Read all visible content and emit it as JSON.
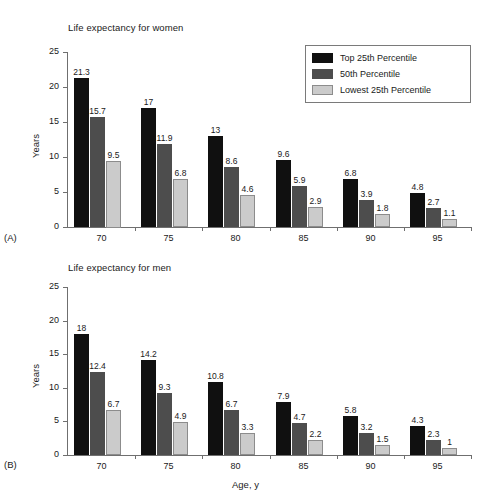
{
  "figure": {
    "x_axis_label": "Age, y",
    "y_axis_label_a": "Years",
    "y_axis_label_b": "Years",
    "panel_a_tag": "(A)",
    "panel_b_tag": "(B)",
    "panel_a_title": "Life expectancy for women",
    "panel_b_title": "Life expectancy for men"
  },
  "legend": {
    "items": [
      {
        "label": "Top 25th Percentile",
        "color": "#101010"
      },
      {
        "label": "50th Percentile",
        "color": "#4d4d4d"
      },
      {
        "label": "Lowest 25th Percentile",
        "color": "#cbcbcb"
      }
    ]
  },
  "chart_data": [
    {
      "type": "bar",
      "title": "Life expectancy for women",
      "panel": "(A)",
      "xlabel": "",
      "ylabel": "Years",
      "categories": [
        "70",
        "75",
        "80",
        "85",
        "90",
        "95"
      ],
      "ylim": [
        0,
        25
      ],
      "yticks": [
        "0",
        "5",
        "10",
        "15",
        "20",
        "25"
      ],
      "grid": false,
      "legend_position": "top-right",
      "series": [
        {
          "name": "Top 25th Percentile",
          "color": "#101010",
          "values": [
            21.3,
            17,
            13,
            9.6,
            6.8,
            4.8
          ],
          "labels": [
            "21.3",
            "17",
            "13",
            "9.6",
            "6.8",
            "4.8"
          ]
        },
        {
          "name": "50th Percentile",
          "color": "#4d4d4d",
          "values": [
            15.7,
            11.9,
            8.6,
            5.9,
            3.9,
            2.7
          ],
          "labels": [
            "15.7",
            "11.9",
            "8.6",
            "5.9",
            "3.9",
            "2.7"
          ]
        },
        {
          "name": "Lowest 25th Percentile",
          "color": "#cbcbcb",
          "values": [
            9.5,
            6.8,
            4.6,
            2.9,
            1.8,
            1.1
          ],
          "labels": [
            "9.5",
            "6.8",
            "4.6",
            "2.9",
            "1.8",
            "1.1"
          ]
        }
      ]
    },
    {
      "type": "bar",
      "title": "Life expectancy for men",
      "panel": "(B)",
      "xlabel": "Age, y",
      "ylabel": "Years",
      "categories": [
        "70",
        "75",
        "80",
        "85",
        "90",
        "95"
      ],
      "ylim": [
        0,
        25
      ],
      "yticks": [
        "0",
        "5",
        "10",
        "15",
        "20",
        "25"
      ],
      "grid": false,
      "legend_position": "none",
      "series": [
        {
          "name": "Top 25th Percentile",
          "color": "#101010",
          "values": [
            18,
            14.2,
            10.8,
            7.9,
            5.8,
            4.3
          ],
          "labels": [
            "18",
            "14.2",
            "10.8",
            "7.9",
            "5.8",
            "4.3"
          ]
        },
        {
          "name": "50th Percentile",
          "color": "#4d4d4d",
          "values": [
            12.4,
            9.3,
            6.7,
            4.7,
            3.2,
            2.3
          ],
          "labels": [
            "12.4",
            "9.3",
            "6.7",
            "4.7",
            "3.2",
            "2.3"
          ]
        },
        {
          "name": "Lowest 25th Percentile",
          "color": "#cbcbcb",
          "values": [
            6.7,
            4.9,
            3.3,
            2.2,
            1.5,
            1
          ],
          "labels": [
            "6.7",
            "4.9",
            "3.3",
            "2.2",
            "1.5",
            "1"
          ]
        }
      ]
    }
  ]
}
